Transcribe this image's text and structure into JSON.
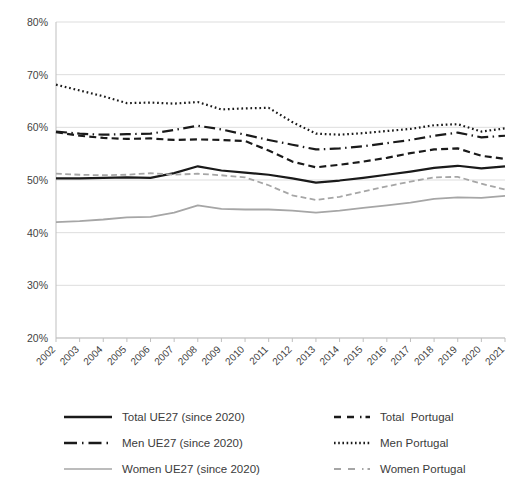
{
  "chart_data": {
    "type": "line",
    "title": "",
    "subtitle": "",
    "xlabel": "",
    "ylabel": "",
    "grid": true,
    "legend_position": "bottom",
    "ylim": [
      20,
      80
    ],
    "ytick_step": 10,
    "ytick_labels": [
      "80%",
      "70%",
      "60%",
      "50%",
      "40%",
      "30%",
      "20%"
    ],
    "ytick_values": [
      80,
      70,
      60,
      50,
      40,
      30,
      20
    ],
    "categories": [
      "2002",
      "2003",
      "2004",
      "2005",
      "2006",
      "2007",
      "2008",
      "2009",
      "2010",
      "2011",
      "2012",
      "2013",
      "2014",
      "2015",
      "2016",
      "2017",
      "2018",
      "2019",
      "2020",
      "2021"
    ],
    "x": [
      2002,
      2003,
      2004,
      2005,
      2006,
      2007,
      2008,
      2009,
      2010,
      2011,
      2012,
      2013,
      2014,
      2015,
      2016,
      2017,
      2018,
      2019,
      2020,
      2021
    ],
    "series": [
      {
        "name": "Total UE27 (since 2020)",
        "style": "solid",
        "color": "#1a1a1a",
        "width": 2.2,
        "values": [
          50.3,
          50.3,
          50.4,
          50.5,
          50.4,
          51.3,
          52.6,
          51.8,
          51.4,
          51.0,
          50.3,
          49.5,
          49.9,
          50.4,
          51.0,
          51.6,
          52.3,
          52.7,
          52.2,
          52.6
        ]
      },
      {
        "name": "Men UE27 (since 2020)",
        "style": "dash-dot",
        "color": "#1a1a1a",
        "width": 2.2,
        "values": [
          59.2,
          58.8,
          58.6,
          58.7,
          58.8,
          59.5,
          60.3,
          59.6,
          58.6,
          57.6,
          56.7,
          55.8,
          56.0,
          56.4,
          57.0,
          57.6,
          58.4,
          59.0,
          58.1,
          58.4
        ]
      },
      {
        "name": "Women UE27 (since 2020)",
        "style": "solid",
        "color": "#a6a6a6",
        "width": 1.8,
        "values": [
          42.0,
          42.2,
          42.5,
          42.9,
          43.0,
          43.8,
          45.2,
          44.5,
          44.4,
          44.4,
          44.2,
          43.8,
          44.2,
          44.7,
          45.2,
          45.7,
          46.4,
          46.7,
          46.6,
          47.0
        ]
      },
      {
        "name": "Total  Portugal",
        "style": "dashed",
        "color": "#1a1a1a",
        "width": 2.2,
        "values": [
          59.1,
          58.4,
          58.0,
          57.8,
          57.9,
          57.6,
          57.7,
          57.6,
          57.4,
          55.6,
          53.5,
          52.4,
          52.9,
          53.5,
          54.2,
          55.1,
          55.8,
          56.0,
          54.6,
          54.0
        ]
      },
      {
        "name": "Men Portugal",
        "style": "dotted",
        "color": "#1a1a1a",
        "width": 2.2,
        "values": [
          68.1,
          67.0,
          65.9,
          64.6,
          64.7,
          64.5,
          64.8,
          63.4,
          63.6,
          63.7,
          61.0,
          58.8,
          58.6,
          58.9,
          59.3,
          59.7,
          60.4,
          60.6,
          59.2,
          59.8
        ]
      },
      {
        "name": "Women Portugal",
        "style": "dashed",
        "color": "#a6a6a6",
        "width": 1.8,
        "values": [
          51.2,
          51.0,
          50.9,
          51.0,
          51.3,
          51.0,
          51.2,
          50.9,
          50.5,
          49.0,
          47.1,
          46.2,
          46.8,
          47.8,
          48.8,
          49.7,
          50.5,
          50.6,
          49.3,
          48.2
        ]
      }
    ]
  },
  "legend": {
    "left_items": [
      {
        "label": "Total UE27 (since 2020)",
        "key": "solid-black-key"
      },
      {
        "label": "Men UE27 (since 2020)",
        "key": "dash-dot-black-key"
      },
      {
        "label": "Women UE27 (since 2020)",
        "key": "solid-grey-key"
      }
    ],
    "right_items": [
      {
        "label": "Total  Portugal",
        "key": "dashed-black-key"
      },
      {
        "label": "Men Portugal",
        "key": "dotted-black-key"
      },
      {
        "label": "Women Portugal",
        "key": "dashed-grey-key"
      }
    ]
  },
  "colors": {
    "black_series": "#1a1a1a",
    "grey_series": "#a6a6a6",
    "gridline": "#d9d9d9",
    "axis": "#bfbfbf",
    "text": "#3f3f3f"
  }
}
